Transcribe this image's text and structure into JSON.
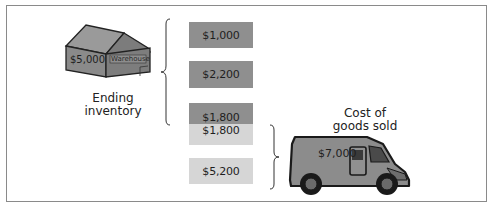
{
  "diagram": {
    "warehouse": {
      "value": "$5,000",
      "sign": "Warehouse",
      "caption_line1": "Ending",
      "caption_line2": "inventory"
    },
    "inventory_boxes": [
      {
        "value": "$1,000",
        "shade": "dark"
      },
      {
        "value": "$2,200",
        "shade": "dark"
      },
      {
        "value": "$1,800",
        "shade": "dark"
      }
    ],
    "cogs_boxes": [
      {
        "value": "$1,800",
        "shade": "light"
      },
      {
        "value": "$5,200",
        "shade": "light"
      }
    ],
    "van": {
      "value": "$7,000",
      "caption_line1": "Cost of",
      "caption_line2": "goods sold"
    },
    "colors": {
      "dark_box": "#8f8f8f",
      "light_box": "#d6d6d6",
      "frame": "#8a8a8a"
    }
  }
}
